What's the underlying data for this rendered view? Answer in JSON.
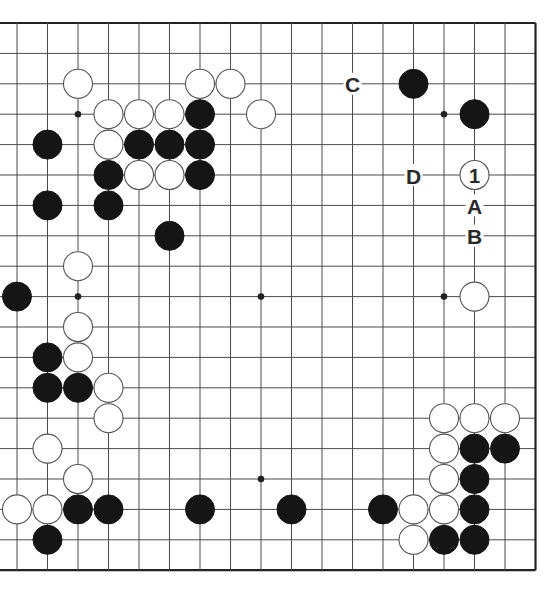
{
  "board": {
    "size": 19,
    "visible_columns": [
      2,
      19
    ],
    "visible_rows": [
      1,
      19
    ],
    "colors": {
      "background": "#ffffff",
      "grid": "#4a4a4a",
      "border": "#222222",
      "black_stone": "#151515",
      "white_stone": "#ffffff",
      "white_outline": "#555555",
      "label": "#2a2a2a"
    },
    "star_points": [
      {
        "col": 4,
        "row": 4
      },
      {
        "col": 10,
        "row": 4
      },
      {
        "col": 16,
        "row": 4
      },
      {
        "col": 4,
        "row": 10
      },
      {
        "col": 10,
        "row": 10
      },
      {
        "col": 16,
        "row": 10
      },
      {
        "col": 4,
        "row": 16
      },
      {
        "col": 10,
        "row": 16
      },
      {
        "col": 16,
        "row": 16
      }
    ],
    "black_stones": [
      {
        "col": 8,
        "row": 4
      },
      {
        "col": 3,
        "row": 5
      },
      {
        "col": 6,
        "row": 5
      },
      {
        "col": 7,
        "row": 5
      },
      {
        "col": 8,
        "row": 5
      },
      {
        "col": 5,
        "row": 6
      },
      {
        "col": 8,
        "row": 6
      },
      {
        "col": 3,
        "row": 7
      },
      {
        "col": 5,
        "row": 7
      },
      {
        "col": 7,
        "row": 8
      },
      {
        "col": 2,
        "row": 10
      },
      {
        "col": 3,
        "row": 12
      },
      {
        "col": 3,
        "row": 13
      },
      {
        "col": 4,
        "row": 13
      },
      {
        "col": 4,
        "row": 17
      },
      {
        "col": 5,
        "row": 17
      },
      {
        "col": 8,
        "row": 17
      },
      {
        "col": 11,
        "row": 17
      },
      {
        "col": 3,
        "row": 18
      },
      {
        "col": 15,
        "row": 3
      },
      {
        "col": 17,
        "row": 4
      },
      {
        "col": 17,
        "row": 15
      },
      {
        "col": 18,
        "row": 15
      },
      {
        "col": 17,
        "row": 16
      },
      {
        "col": 14,
        "row": 17
      },
      {
        "col": 17,
        "row": 17
      },
      {
        "col": 16,
        "row": 18
      },
      {
        "col": 17,
        "row": 18
      }
    ],
    "white_stones": [
      {
        "col": 4,
        "row": 3
      },
      {
        "col": 8,
        "row": 3
      },
      {
        "col": 9,
        "row": 3
      },
      {
        "col": 5,
        "row": 4
      },
      {
        "col": 6,
        "row": 4
      },
      {
        "col": 7,
        "row": 4
      },
      {
        "col": 10,
        "row": 4
      },
      {
        "col": 5,
        "row": 5
      },
      {
        "col": 6,
        "row": 6
      },
      {
        "col": 7,
        "row": 6
      },
      {
        "col": 4,
        "row": 9
      },
      {
        "col": 4,
        "row": 11
      },
      {
        "col": 4,
        "row": 12
      },
      {
        "col": 5,
        "row": 13
      },
      {
        "col": 5,
        "row": 14
      },
      {
        "col": 3,
        "row": 15
      },
      {
        "col": 4,
        "row": 16
      },
      {
        "col": 2,
        "row": 17
      },
      {
        "col": 3,
        "row": 17
      },
      {
        "col": 17,
        "row": 10
      },
      {
        "col": 16,
        "row": 14
      },
      {
        "col": 17,
        "row": 14
      },
      {
        "col": 18,
        "row": 14
      },
      {
        "col": 16,
        "row": 15
      },
      {
        "col": 16,
        "row": 16
      },
      {
        "col": 15,
        "row": 17
      },
      {
        "col": 16,
        "row": 17
      },
      {
        "col": 15,
        "row": 18
      }
    ],
    "numbered_stones": [
      {
        "col": 17,
        "row": 6,
        "color": "white",
        "label": "1"
      }
    ],
    "labels": [
      {
        "col": 13,
        "row": 3,
        "text": "C"
      },
      {
        "col": 15,
        "row": 6,
        "text": "D"
      },
      {
        "col": 17,
        "row": 7,
        "text": "A"
      },
      {
        "col": 17,
        "row": 8,
        "text": "B"
      }
    ]
  }
}
